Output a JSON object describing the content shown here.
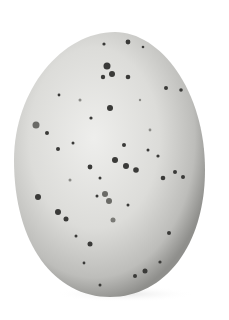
{
  "image": {
    "subject": "Speckled bird egg",
    "description": "A single pale grey egg with scattered dark brown-grey speckles on a white background",
    "colors": {
      "background": "#ffffff",
      "shell_light": "#e6e6e4",
      "shell_mid": "#c9c9c6",
      "shell_shadow": "#8f8f8c",
      "speckle_dark": "#3a3a38",
      "speckle_faint": "#8a8a86"
    }
  }
}
